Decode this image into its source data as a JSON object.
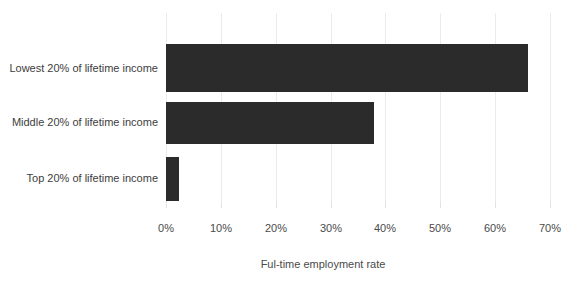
{
  "chart_data": {
    "type": "bar",
    "orientation": "horizontal",
    "title": "",
    "xlabel": "Ful-time employment rate",
    "ylabel": "",
    "categories": [
      "Lowest 20% of lifetime income",
      "Middle 20% of lifetime income",
      "Top 20% of lifetime income"
    ],
    "values": [
      66,
      38,
      2.4
    ],
    "value_unit": "%",
    "xlim": [
      0,
      70
    ],
    "xticks": [
      0,
      10,
      20,
      30,
      40,
      50,
      60,
      70
    ],
    "xtick_labels": [
      "0%",
      "10%",
      "20%",
      "30%",
      "40%",
      "50%",
      "60%",
      "70%"
    ],
    "grid": "vertical",
    "legend": "none",
    "series": [
      {
        "name": "Ful-time employment rate",
        "values": [
          66,
          38,
          2.4
        ]
      }
    ],
    "colors": {
      "bar": "#2b2b2b",
      "gridline": "#ebebeb",
      "background": "#ffffff",
      "label_text": "#3d3d3d",
      "axis_text": "#4a4a4a"
    }
  }
}
